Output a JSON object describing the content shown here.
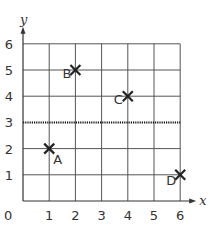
{
  "chart_data": {
    "type": "scatter",
    "title": "",
    "xlabel": "x",
    "ylabel": "y",
    "xlim": [
      0,
      6
    ],
    "ylim": [
      0,
      6
    ],
    "grid": true,
    "x_ticks": [
      "0",
      "1",
      "2",
      "3",
      "4",
      "5",
      "6"
    ],
    "y_ticks": [
      "1",
      "2",
      "3",
      "4",
      "5",
      "6"
    ],
    "points": [
      {
        "label": "A",
        "x": 1,
        "y": 2,
        "marker": "cross"
      },
      {
        "label": "B",
        "x": 2,
        "y": 5,
        "marker": "cross"
      },
      {
        "label": "C",
        "x": 4,
        "y": 4,
        "marker": "cross"
      },
      {
        "label": "D",
        "x": 6,
        "y": 1,
        "marker": "cross"
      }
    ],
    "lines": [
      {
        "type": "horizontal",
        "y": 3,
        "style": "dotted"
      }
    ],
    "legend": null
  },
  "colors": {
    "grid": "#555555",
    "marker": "#222222",
    "text": "#333333"
  }
}
